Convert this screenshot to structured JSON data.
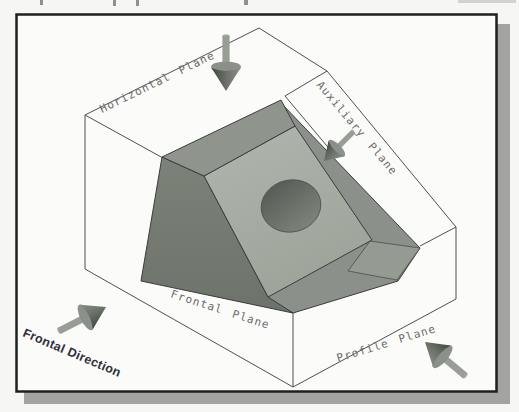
{
  "figure": {
    "type": "glass-box projection diagram",
    "labels": {
      "horizontal_plane": "Horizontal Plane",
      "auxiliary_plane": "Auxiliary Plane",
      "frontal_plane": "Frontal Plane",
      "profile_plane": "Profile Plane",
      "frontal_direction": "Frontal Direction"
    },
    "arrows": [
      {
        "name": "horizontal-projection-arrow",
        "points": "down"
      },
      {
        "name": "auxiliary-projection-arrow",
        "points": "down-left"
      },
      {
        "name": "frontal-projection-arrow",
        "points": "up-right"
      },
      {
        "name": "profile-projection-arrow",
        "points": "up-left"
      }
    ],
    "colors": {
      "frame_border": "#1f1f1f",
      "frame_shadow": "#a3a3a1",
      "page_background": "#f6f6f4",
      "plane_fill": "#fbfbf9",
      "object_left_face": "#757a72",
      "object_top_face": "#8f948d",
      "object_inclined_face": "#a8ada5",
      "object_right_face": "#8b908a",
      "object_ledge": "#959a93",
      "hole_dark": "#555a54",
      "hole_light": "#7d827a",
      "box_line": "#4f4f4f",
      "label_text": "#6b6b6b",
      "direction_text": "#30303a"
    }
  }
}
